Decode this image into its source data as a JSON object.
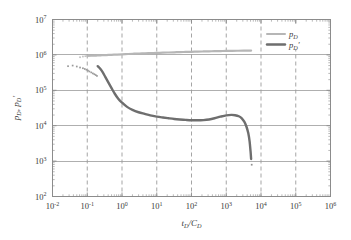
{
  "chart_data": {
    "type": "line",
    "title": "",
    "xlabel": "t_D/C_D",
    "ylabel": "p_D, p_D'",
    "xscale": "log",
    "yscale": "log",
    "xlim": [
      0.01,
      1000000
    ],
    "ylim": [
      100,
      10000000
    ],
    "grid": true,
    "grid_x_style": "dashed",
    "grid_y_style": "solid",
    "legend_position": "top-right-inside",
    "xticks": [
      "10^-2",
      "10^-1",
      "10^0",
      "10^1",
      "10^2",
      "10^3",
      "10^4",
      "10^5",
      "10^6"
    ],
    "xtick_values": [
      0.01,
      0.1,
      1,
      10,
      100,
      1000,
      10000,
      100000,
      1000000
    ],
    "yticks": [
      "10^2",
      "10^3",
      "10^4",
      "10^5",
      "10^6",
      "10^7"
    ],
    "ytick_values": [
      100,
      1000,
      10000,
      100000,
      1000000,
      10000000
    ],
    "series": [
      {
        "name": "p_D",
        "label_base": "p",
        "label_sub": "D",
        "label_prime": "",
        "color": "#b6b6b6",
        "style": "solid",
        "width": 2.2,
        "x": [
          0.1,
          0.13,
          0.18,
          0.25,
          0.35,
          0.5,
          0.7,
          1.0,
          1.5,
          2.2,
          3.2,
          4.6,
          6.8,
          10,
          15,
          22,
          32,
          46,
          68,
          100,
          150,
          220,
          320,
          460,
          680,
          1000,
          1500,
          2200,
          3200,
          4600,
          5200
        ],
        "y": [
          930000,
          945000,
          960000,
          975000,
          990000,
          1005000,
          1020000,
          1040000,
          1060000,
          1080000,
          1095000,
          1110000,
          1125000,
          1140000,
          1155000,
          1170000,
          1185000,
          1200000,
          1210000,
          1225000,
          1240000,
          1250000,
          1262000,
          1275000,
          1285000,
          1295000,
          1305000,
          1312000,
          1318000,
          1322000,
          1324000
        ]
      },
      {
        "name": "p_D_derivative",
        "label_base": "p",
        "label_sub": "D",
        "label_prime": "'",
        "color": "#6e6e6e",
        "style": "solid",
        "width": 2.4,
        "x": [
          0.2,
          0.24,
          0.28,
          0.33,
          0.4,
          0.5,
          0.62,
          0.78,
          1.0,
          1.4,
          2.0,
          3.0,
          4.5,
          6.5,
          10,
          15,
          22,
          32,
          46,
          68,
          100,
          150,
          220,
          320,
          460,
          680,
          1000,
          1400,
          1800,
          2300,
          2800,
          3300,
          3800,
          4300,
          4700,
          5000,
          5200
        ],
        "y": [
          480000,
          400000,
          320000,
          240000,
          170000,
          115000,
          80000,
          58000,
          45000,
          34000,
          28000,
          24000,
          21500,
          19500,
          18000,
          17000,
          16200,
          15500,
          15000,
          14600,
          14300,
          14200,
          14400,
          15000,
          16200,
          18000,
          19600,
          20200,
          19800,
          18500,
          16200,
          13000,
          9500,
          6200,
          3600,
          1900,
          1150
        ]
      },
      {
        "name": "p_D_derivative_early_points",
        "type": "scatter",
        "color": "#9a9a9a",
        "x": [
          0.028,
          0.038,
          0.05,
          0.062,
          0.075,
          0.085,
          0.095,
          0.105,
          0.115,
          0.13,
          0.145,
          0.16,
          0.175,
          0.19
        ],
        "y": [
          480000,
          500000,
          470000,
          440000,
          420000,
          400000,
          380000,
          360000,
          340000,
          320000,
          300000,
          285000,
          270000,
          255000
        ]
      },
      {
        "name": "p_D_early_points",
        "type": "scatter",
        "color": "#c2c2c2",
        "x": [
          0.062,
          0.075,
          0.088
        ],
        "y": [
          860000,
          900000,
          920000
        ]
      },
      {
        "name": "tail_points",
        "type": "scatter",
        "color": "#8f8f8f",
        "x": [
          5400
        ],
        "y": [
          790
        ]
      }
    ]
  },
  "legend": {
    "items": [
      {
        "base": "p",
        "sub": "D",
        "prime": "",
        "color": "#b6b6b6"
      },
      {
        "base": "p",
        "sub": "D",
        "prime": "′",
        "color": "#6e6e6e"
      }
    ]
  },
  "axis": {
    "x_title_num": "t",
    "x_title_num_sub": "D",
    "x_title_den": "C",
    "x_title_den_sub": "D",
    "x_title_sep": "/",
    "y_title_1": "p",
    "y_title_1_sub": "D",
    "y_title_sep": ", ",
    "y_title_2": "p",
    "y_title_2_sub": "D",
    "y_title_2_prime": "′"
  },
  "style": {
    "frame_color": "#8c8c8c",
    "grid_h_color": "#9b9b9b",
    "grid_v_color": "#9b9b9b",
    "background": "#ffffff",
    "text_color": "#3a3a3a"
  }
}
